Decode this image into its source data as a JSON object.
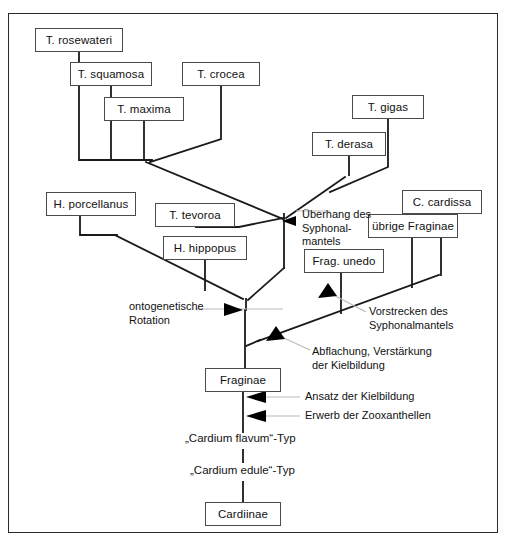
{
  "diagram": {
    "frame_color": "#2a2a2a",
    "line_color": "#1a1a1a",
    "leader_color": "#b9b9b9",
    "nodes": [
      {
        "id": "rosewateri",
        "label": "T. rosewateri",
        "x": 35,
        "y": 28,
        "w": 88,
        "h": 24
      },
      {
        "id": "squamosa",
        "label": "T. squamosa",
        "x": 70,
        "y": 62,
        "w": 82,
        "h": 24
      },
      {
        "id": "crocea",
        "label": "T. crocea",
        "x": 182,
        "y": 62,
        "w": 78,
        "h": 24
      },
      {
        "id": "maxima",
        "label": "T. maxima",
        "x": 104,
        "y": 97,
        "w": 80,
        "h": 24
      },
      {
        "id": "gigas",
        "label": "T. gigas",
        "x": 352,
        "y": 95,
        "w": 72,
        "h": 24
      },
      {
        "id": "derasa",
        "label": "T. derasa",
        "x": 312,
        "y": 132,
        "w": 74,
        "h": 24
      },
      {
        "id": "porcellanus",
        "label": "H. porcellanus",
        "x": 46,
        "y": 192,
        "w": 90,
        "h": 24
      },
      {
        "id": "tevoroa",
        "label": "T. tevoroa",
        "x": 155,
        "y": 203,
        "w": 80,
        "h": 24
      },
      {
        "id": "cardissa",
        "label": "C. cardissa",
        "x": 402,
        "y": 190,
        "w": 80,
        "h": 24
      },
      {
        "id": "ubrige",
        "label": "übrige Fraginae",
        "x": 368,
        "y": 214,
        "w": 90,
        "h": 24
      },
      {
        "id": "hippopus",
        "label": "H. hippopus",
        "x": 163,
        "y": 236,
        "w": 84,
        "h": 24
      },
      {
        "id": "unedo",
        "label": "Frag. unedo",
        "x": 304,
        "y": 249,
        "w": 80,
        "h": 24
      },
      {
        "id": "fraginae",
        "label": "Fraginae",
        "x": 205,
        "y": 368,
        "w": 76,
        "h": 24
      },
      {
        "id": "cardiinae",
        "label": "Cardiinae",
        "x": 205,
        "y": 502,
        "w": 76,
        "h": 24
      }
    ],
    "annotations": [
      {
        "id": "uberhang",
        "text": "Überhang des\nSyphonal-\nmantels",
        "x": 302,
        "y": 208
      },
      {
        "id": "vorstrecken",
        "text": "Vorstrecken des\nSyphonalmantels",
        "x": 369,
        "y": 305
      },
      {
        "id": "ontogen",
        "text": "ontogenetische\nRotation",
        "x": 129,
        "y": 300
      },
      {
        "id": "abflachung",
        "text": "Abflachung, Verstärkung\nder Kielbildung",
        "x": 312,
        "y": 345
      },
      {
        "id": "ansatz",
        "text": "Ansatz der Kielbildung",
        "x": 305,
        "y": 393
      },
      {
        "id": "erwerb",
        "text": "Erwerb der Zooxanthellen",
        "x": 305,
        "y": 412
      }
    ],
    "stage_labels": [
      {
        "id": "flavum",
        "text": "„Cardium flavum“-Typ",
        "x": 185,
        "y": 438
      },
      {
        "id": "edule",
        "text": "„Cardium edule“-Typ",
        "x": 190,
        "y": 470
      }
    ]
  }
}
